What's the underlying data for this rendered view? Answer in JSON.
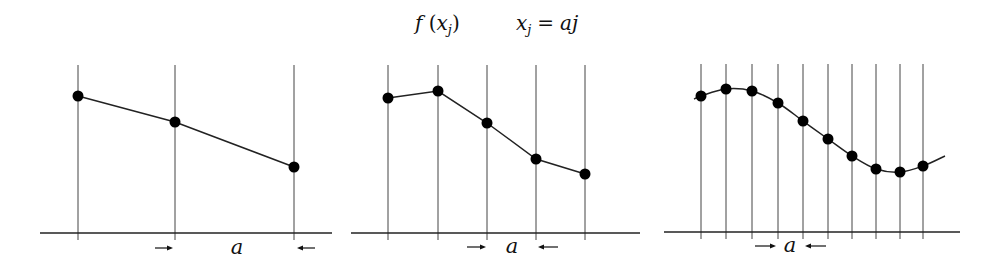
{
  "title": {
    "func_label": "f",
    "func_arg": "x",
    "func_sub": "j",
    "def_lhs": "x",
    "def_lhs_sub": "j",
    "def_eq": "=",
    "def_rhs": "aj"
  },
  "panels": [
    {
      "name": "coarse",
      "spacing_label": "a",
      "axis": {
        "x1": 40,
        "x2": 332,
        "y": 233
      },
      "grid_top": 65,
      "grid_bottom": 240,
      "points": [
        [
          78,
          96
        ],
        [
          175,
          122
        ],
        [
          294,
          167
        ]
      ],
      "curve": [
        [
          78,
          96
        ],
        [
          175,
          122
        ],
        [
          294,
          167
        ]
      ],
      "smooth": false,
      "arrows": {
        "y": 248,
        "right": [
          155,
          173
        ],
        "label_x": 237,
        "left": [
          315,
          297
        ]
      }
    },
    {
      "name": "medium",
      "spacing_label": "a",
      "axis": {
        "x1": 351,
        "x2": 640,
        "y": 233
      },
      "grid_top": 65,
      "grid_bottom": 240,
      "points": [
        [
          388,
          98
        ],
        [
          438,
          91
        ],
        [
          487,
          123
        ],
        [
          536,
          159
        ],
        [
          585,
          174
        ]
      ],
      "curve": [
        [
          388,
          98
        ],
        [
          438,
          91
        ],
        [
          487,
          123
        ],
        [
          536,
          159
        ],
        [
          585,
          174
        ]
      ],
      "smooth": false,
      "arrows": {
        "y": 247,
        "right": [
          467,
          486
        ],
        "label_x": 512,
        "left": [
          558,
          538
        ]
      }
    },
    {
      "name": "fine",
      "spacing_label": "a",
      "axis": {
        "x1": 664,
        "x2": 960,
        "y": 232
      },
      "grid_top": 64,
      "grid_bottom": 239,
      "points": [
        [
          701,
          96
        ],
        [
          726,
          89
        ],
        [
          752,
          91
        ],
        [
          778,
          103
        ],
        [
          803,
          121
        ],
        [
          828,
          139
        ],
        [
          852,
          156
        ],
        [
          876,
          169
        ],
        [
          900,
          172
        ],
        [
          923,
          166
        ]
      ],
      "curve": [
        [
          694,
          99
        ],
        [
          701,
          96
        ],
        [
          726,
          89
        ],
        [
          752,
          91
        ],
        [
          778,
          103
        ],
        [
          803,
          121
        ],
        [
          828,
          139
        ],
        [
          852,
          156
        ],
        [
          876,
          169
        ],
        [
          900,
          172
        ],
        [
          923,
          166
        ],
        [
          945,
          156
        ]
      ],
      "smooth": true,
      "arrows": {
        "y": 246,
        "right": [
          755,
          776
        ],
        "label_x": 790,
        "left": [
          826,
          805
        ]
      }
    }
  ]
}
